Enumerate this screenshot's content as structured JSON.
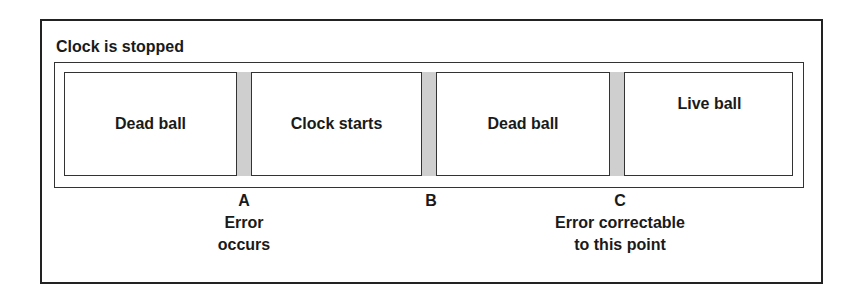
{
  "title": "Clock is stopped",
  "segments": [
    {
      "label": "Dead ball"
    },
    {
      "label": "Clock starts"
    },
    {
      "label": "Dead ball"
    },
    {
      "label": "Live ball"
    }
  ],
  "markers": [
    {
      "letter": "A",
      "line1": "Error",
      "line2": "occurs"
    },
    {
      "letter": "B",
      "line1": "",
      "line2": ""
    },
    {
      "letter": "C",
      "line1": "Error correctable",
      "line2": "to this point"
    }
  ],
  "colors": {
    "separator_fill": "#cfcfcf",
    "border": "#222222"
  }
}
